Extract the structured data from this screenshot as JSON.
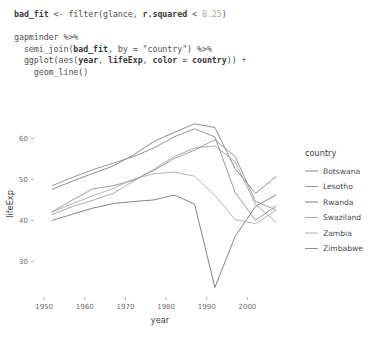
{
  "code": {
    "lines": [
      [
        {
          "t": "bad_fit ",
          "c": "b"
        },
        {
          "t": "<- ",
          "c": "plain"
        },
        {
          "t": "filter",
          "c": "plain"
        },
        {
          "t": "(glance, ",
          "c": "plain"
        },
        {
          "t": "r.squared",
          "c": "b"
        },
        {
          "t": " < ",
          "c": "plain"
        },
        {
          "t": "0.25",
          "c": "num"
        },
        {
          "t": ")",
          "c": "plain"
        }
      ],
      [],
      [
        {
          "t": "gapminder ",
          "c": "plain"
        },
        {
          "t": "%>%",
          "c": "plain"
        }
      ],
      [
        {
          "t": "  semi_join(",
          "c": "plain"
        },
        {
          "t": "bad_fit",
          "c": "b"
        },
        {
          "t": ", by = ",
          "c": "plain"
        },
        {
          "t": "\"country\"",
          "c": "str"
        },
        {
          "t": ") ",
          "c": "plain"
        },
        {
          "t": "%>%",
          "c": "plain"
        }
      ],
      [
        {
          "t": "  ggplot(",
          "c": "plain"
        },
        {
          "t": "aes",
          "c": "plain"
        },
        {
          "t": "(",
          "c": "plain"
        },
        {
          "t": "year",
          "c": "b"
        },
        {
          "t": ", ",
          "c": "plain"
        },
        {
          "t": "lifeExp",
          "c": "b"
        },
        {
          "t": ", ",
          "c": "plain"
        },
        {
          "t": "color",
          "c": "b"
        },
        {
          "t": " = ",
          "c": "plain"
        },
        {
          "t": "country",
          "c": "b"
        },
        {
          "t": ")) +",
          "c": "plain"
        }
      ],
      [
        {
          "t": "    geom_line()",
          "c": "plain"
        }
      ]
    ]
  },
  "chart_data": {
    "type": "line",
    "title": "",
    "xlabel": "year",
    "ylabel": "lifeExp",
    "xlim": [
      1948,
      2009
    ],
    "ylim": [
      22,
      66
    ],
    "xticks": [
      1950,
      1960,
      1970,
      1980,
      1990,
      2000
    ],
    "yticks": [
      30,
      40,
      50,
      60
    ],
    "grid": false,
    "legend": {
      "title": "country",
      "position": "right"
    },
    "x": [
      1952,
      1957,
      1962,
      1967,
      1972,
      1977,
      1982,
      1987,
      1992,
      1997,
      2002,
      2007
    ],
    "series": [
      {
        "name": "Botswana",
        "color": "#7a7a7a",
        "values": [
          47.6,
          49.6,
          51.5,
          53.3,
          56.0,
          59.3,
          61.5,
          63.6,
          62.7,
          52.6,
          46.6,
          50.7
        ]
      },
      {
        "name": "Lesotho",
        "color": "#8d8d8d",
        "values": [
          42.1,
          45.0,
          47.7,
          48.5,
          49.8,
          52.2,
          55.1,
          57.2,
          59.7,
          55.6,
          44.6,
          42.6
        ]
      },
      {
        "name": "Rwanda",
        "color": "#6e6e6e",
        "values": [
          40.0,
          41.5,
          43.0,
          44.1,
          44.6,
          45.0,
          46.2,
          44.0,
          23.6,
          36.1,
          43.4,
          46.2
        ]
      },
      {
        "name": "Swaziland",
        "color": "#9c9c9c",
        "values": [
          41.4,
          43.4,
          44.9,
          46.6,
          49.6,
          52.5,
          55.6,
          57.7,
          58.2,
          54.3,
          43.9,
          39.6
        ]
      },
      {
        "name": "Zambia",
        "color": "#a8a8a8",
        "values": [
          42.0,
          44.1,
          46.0,
          47.8,
          50.1,
          51.4,
          51.8,
          50.8,
          46.1,
          40.2,
          39.2,
          42.4
        ]
      },
      {
        "name": "Zimbabwe",
        "color": "#858585",
        "values": [
          48.5,
          50.5,
          52.4,
          54.0,
          55.6,
          57.7,
          60.4,
          62.4,
          60.4,
          46.8,
          40.0,
          43.5
        ]
      }
    ]
  }
}
